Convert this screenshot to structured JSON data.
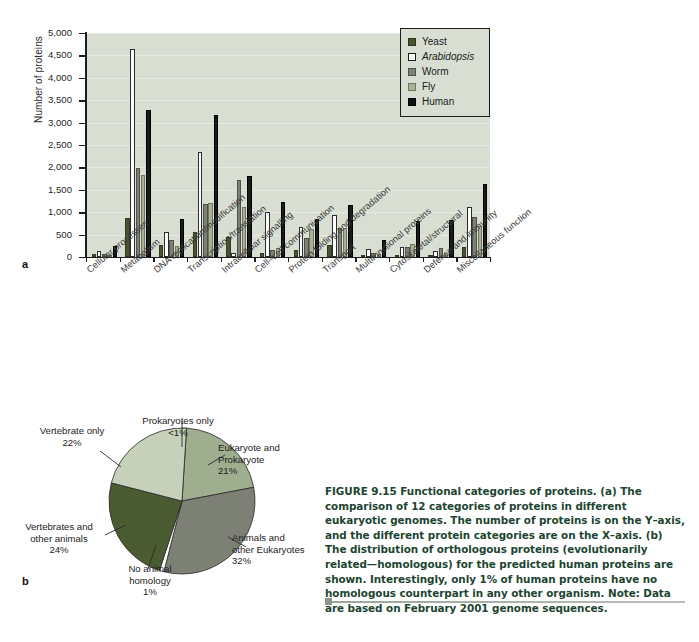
{
  "figure": {
    "panel_a_letter": "a",
    "panel_b_letter": "b"
  },
  "caption": {
    "figure_number": "FIGURE 9.15",
    "text": " Functional categories of proteins. (a) The comparison of 12 categories of proteins in different eukaryotic genomes. The number of proteins is on the Y–axis, and the different protein categories are on the X–axis. (b) The distribution of orthologous proteins (evolutionarily related—homologous) for the predicted human proteins are shown. Interestingly, only 1% of human proteins have no homologous counterpart in any other organism. Note: Data are based on February 2001 genome sequences."
  },
  "chart_data": [
    {
      "type": "bar",
      "title": "",
      "xlabel": "",
      "ylabel": "Number of proteins",
      "ylim": [
        0,
        5000
      ],
      "ytick_labels": [
        "5,000",
        "4,500",
        "4,000",
        "3,500",
        "3,000",
        "2,500",
        "2,000",
        "1,500",
        "1,000",
        "500",
        "0"
      ],
      "ytick_values": [
        5000,
        4500,
        4000,
        3500,
        3000,
        2500,
        2000,
        1500,
        1000,
        500,
        0
      ],
      "grid": true,
      "legend_position": "top-right",
      "plot_background": "#d9ded3",
      "categories": [
        "Cellular processes",
        "Metabolism",
        "DNA replication/modification",
        "Transcription/translation",
        "Intracellular signalling",
        "Cell–cell communication",
        "Protein folding and degradation",
        "Transport",
        "Multifunctional proteins",
        "Cytoskeletal/structural",
        "Defence and immunity",
        "Miscellaneous function"
      ],
      "series": [
        {
          "name": "Yeast",
          "color": "#4b5232",
          "values": [
            60,
            880,
            260,
            560,
            450,
            100,
            150,
            270,
            30,
            40,
            20,
            230
          ]
        },
        {
          "name": "Arabidopsis",
          "color": "#ffffff",
          "values": [
            130,
            4650,
            560,
            2340,
            90,
            1010,
            680,
            940,
            180,
            220,
            140,
            1120
          ]
        },
        {
          "name": "Worm",
          "color": "#7d8075",
          "values": [
            70,
            1990,
            380,
            1190,
            1730,
            150,
            430,
            640,
            80,
            230,
            200,
            900
          ]
        },
        {
          "name": "Fly",
          "color": "#a9b095",
          "values": [
            55,
            1820,
            250,
            1210,
            1110,
            210,
            620,
            640,
            70,
            300,
            90,
            690
          ]
        },
        {
          "name": "Human",
          "color": "#1b1b1b",
          "values": [
            250,
            3280,
            840,
            3180,
            1800,
            1230,
            850,
            1170,
            390,
            810,
            820,
            1630
          ]
        }
      ]
    },
    {
      "type": "pie",
      "title": "",
      "slices": [
        {
          "label": "Prokaryotes only",
          "pct_text": "<1%",
          "value": 1,
          "color": "#1d1d1d"
        },
        {
          "label": "Eukaryote and\nProkaryote",
          "pct_text": "21%",
          "value": 21,
          "color": "#9fae8f"
        },
        {
          "label": "Animals and\nother Eukaryotes",
          "pct_text": "32%",
          "value": 32,
          "color": "#7d8075"
        },
        {
          "label": "No animal\nhomology",
          "pct_text": "1%",
          "value": 1,
          "color": "#ffffff"
        },
        {
          "label": "Vertebrates and\nother animals",
          "pct_text": "24%",
          "value": 24,
          "color": "#4b5c32"
        },
        {
          "label": "Vertebrate only",
          "pct_text": "22%",
          "value": 22,
          "color": "#c7d0b9"
        }
      ]
    }
  ],
  "legend": {
    "items": [
      {
        "label": "Yeast",
        "color": "#4b5232",
        "italic": false
      },
      {
        "label": "Arabidopsis",
        "color": "#ffffff",
        "italic": true
      },
      {
        "label": "Worm",
        "color": "#7d8075",
        "italic": false
      },
      {
        "label": "Fly",
        "color": "#a9b095",
        "italic": false
      },
      {
        "label": "Human",
        "color": "#1b1b1b",
        "italic": false
      }
    ]
  },
  "pie_labels": [
    {
      "name": "prokaryotes-only",
      "line1": "Prokaryotes only",
      "line2": "",
      "pct": "<1%"
    },
    {
      "name": "eukaryote-and-prokaryote",
      "line1": "Eukaryote and",
      "line2": "Prokaryote",
      "pct": "21%"
    },
    {
      "name": "animals-other-eukaryotes",
      "line1": "Animals and",
      "line2": "other Eukaryotes",
      "pct": "32%"
    },
    {
      "name": "no-animal-homology",
      "line1": "No animal",
      "line2": "homology",
      "pct": "1%"
    },
    {
      "name": "vertebrates-other-animals",
      "line1": "Vertebrates and",
      "line2": "other animals",
      "pct": "24%"
    },
    {
      "name": "vertebrate-only",
      "line1": "Vertebrate only",
      "line2": "",
      "pct": "22%"
    }
  ]
}
